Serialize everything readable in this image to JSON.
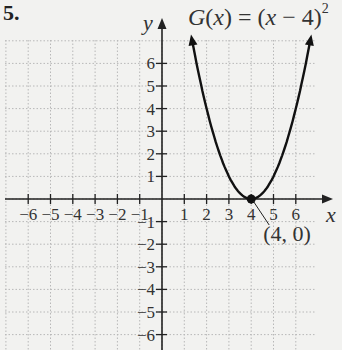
{
  "problem": {
    "number": "5."
  },
  "function_label": {
    "name": "G",
    "var": "x",
    "base": "(x − 4)",
    "exponent": "2",
    "full": "G(x) = (x − 4)^2"
  },
  "colors": {
    "background": "#f2f2f0",
    "axis": "#222222",
    "grid": "#b8b8b8",
    "curve": "#111111",
    "text": "#333333"
  },
  "chart_data": {
    "type": "line",
    "xlabel": "x",
    "ylabel": "y",
    "xlim": [
      -7,
      7
    ],
    "ylim": [
      -7,
      7
    ],
    "grid": true,
    "x_ticks": [
      -6,
      -5,
      -4,
      -3,
      -2,
      -1,
      1,
      2,
      3,
      4,
      5,
      6
    ],
    "y_ticks": [
      -6,
      -5,
      -4,
      -3,
      -2,
      -1,
      1,
      2,
      3,
      4,
      5,
      6
    ],
    "series": [
      {
        "name": "G(x) = (x − 4)^2",
        "x": [
          1.35,
          2,
          2.5,
          3,
          3.5,
          4,
          4.5,
          5,
          5.5,
          6,
          6.65
        ],
        "y": [
          7.02,
          4,
          2.25,
          1,
          0.25,
          0,
          0.25,
          1,
          2.25,
          4,
          7.02
        ]
      }
    ],
    "points": [
      {
        "x": 4,
        "y": 0,
        "label": "(4, 0)"
      }
    ],
    "annotations": [
      {
        "text": "(4, 0)",
        "at": [
          4,
          0
        ]
      }
    ]
  }
}
